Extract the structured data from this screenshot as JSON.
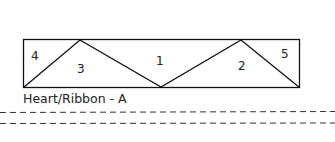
{
  "diagram": {
    "caption": "Heart/Ribbon - A",
    "pieces": [
      {
        "id": "4",
        "label": "4"
      },
      {
        "id": "3",
        "label": "3"
      },
      {
        "id": "1",
        "label": "1"
      },
      {
        "id": "2",
        "label": "2"
      },
      {
        "id": "5",
        "label": "5"
      }
    ],
    "stroke_color": "#111111",
    "dash_color": "#333333"
  }
}
